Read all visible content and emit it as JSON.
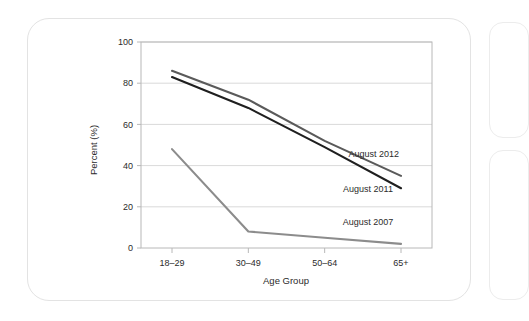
{
  "chart_data": {
    "type": "line",
    "title": "",
    "xlabel": "Age Group",
    "ylabel": "Percent (%)",
    "categories": [
      "18–29",
      "30–49",
      "50–64",
      "65+"
    ],
    "ylim": [
      0,
      100
    ],
    "yticks": [
      0,
      20,
      40,
      60,
      80,
      100
    ],
    "ytick_labels": [
      "0",
      "20",
      "40",
      "60",
      "80",
      "100"
    ],
    "grid": "horizontal",
    "legend_position": "inline-right",
    "series": [
      {
        "name": "August 2012",
        "values": [
          86,
          72,
          52,
          35
        ],
        "color": "#5a5a5a",
        "label_x_pct": 80,
        "label_y_value": 44
      },
      {
        "name": "August 2011",
        "values": [
          83,
          68,
          49,
          29
        ],
        "color": "#1f1f1f",
        "label_x_pct": 78,
        "label_y_value": 27
      },
      {
        "name": "August 2007",
        "values": [
          48,
          8,
          5,
          2
        ],
        "color": "#8c8c8c",
        "label_x_pct": 78,
        "label_y_value": 11
      }
    ]
  },
  "axis": {
    "y_title": "Percent (%)",
    "x_title": "Age Group",
    "x_labels": [
      "18–29",
      "30–49",
      "50–64",
      "65+"
    ],
    "y_labels": [
      "100",
      "80",
      "60",
      "40",
      "20",
      "0"
    ]
  },
  "legend": {
    "items": [
      "August 2012",
      "August 2011",
      "August 2007"
    ]
  },
  "colors": {
    "series_2012": "#5a5a5a",
    "series_2011": "#1f1f1f",
    "series_2007": "#8c8c8c",
    "grid": "#cfcfcf",
    "frame": "#b8b8b8",
    "card_border": "#e3e3e3",
    "text": "#2b2b2b",
    "background": "#ffffff"
  }
}
